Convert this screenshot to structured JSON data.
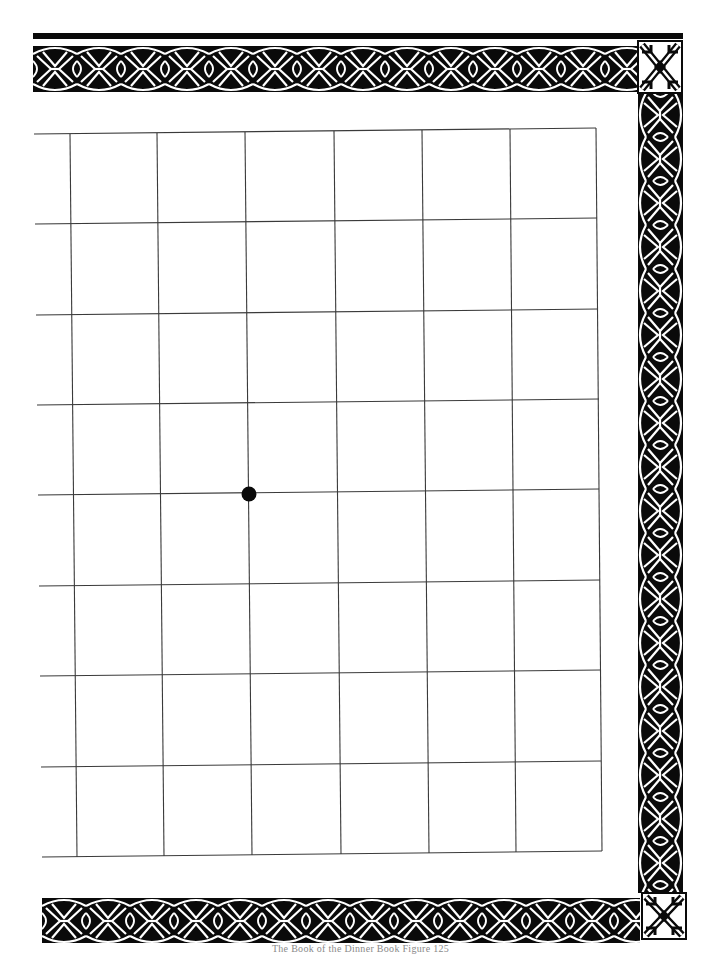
{
  "page": {
    "footer_text": "The Book of the Dinner Book Figure 125",
    "colors": {
      "ink": "#0a0a0a",
      "paper": "#ffffff",
      "grid_line": "#3a3a3a",
      "footer": "#8a8a8a"
    }
  },
  "border": {
    "style": "celtic-knot",
    "top_band": "knotwork band",
    "right_band": "knotwork band",
    "bottom_band": "knotwork band",
    "corners": [
      "square-knot-corner-top-right",
      "square-knot-corner-bottom-right"
    ]
  },
  "grid": {
    "rows": 8,
    "cols_visible": 7,
    "partial_left_column": true,
    "top_left": [
      34,
      134
    ],
    "top_right": [
      596,
      128
    ],
    "bottom_right": [
      602,
      851
    ],
    "bottom_left": [
      42,
      857
    ],
    "col_lines_top": [
      70,
      157,
      245,
      334,
      422,
      510
    ],
    "col_lines_bottom": [
      77,
      164,
      252,
      341,
      429,
      516
    ],
    "row_lines_left": [
      224,
      315,
      405,
      495,
      586,
      676,
      767
    ],
    "marker": {
      "type": "dot",
      "cx": 249,
      "cy": 494,
      "r": 7
    }
  }
}
